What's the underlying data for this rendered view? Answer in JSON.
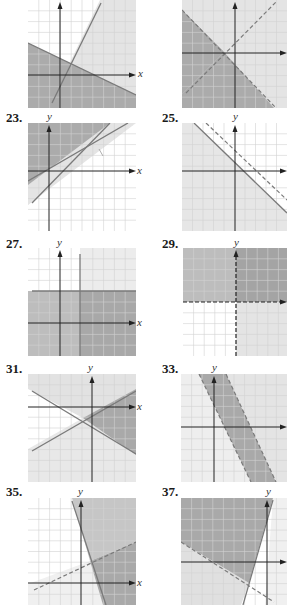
{
  "page": {
    "type": "textbook answer key — graphs of systems of linear inequalities"
  },
  "axis_labels": {
    "x": "x",
    "y": "y"
  },
  "colors": {
    "background": "#ffffff",
    "grid_line": "#d0d0d0",
    "light_shade": "#e6e6e6",
    "dark_shade": "#a9a9a9",
    "boundary_line": "#7a7a7a",
    "axis": "#222222"
  },
  "problems": [
    {
      "number": "",
      "description": "Two solid lines: steep increasing line and decreasing line; region below decreasing line shaded dark (overlap), lighter shade right of steep line"
    },
    {
      "number": "",
      "description": "Two dashed lines crossing left of origin forming X; left and bottom wedge shaded dark"
    },
    {
      "number": "23.",
      "description": "Two solid increasing lines; region above both shaded dark"
    },
    {
      "number": "25.",
      "description": "Two parallel decreasing lines (solid and dashed); region below solid line shaded light"
    },
    {
      "number": "27.",
      "description": "Solid vertical line x≈2 and solid horizontal line y≈3; region below horizontal shaded, right of vertical darker"
    },
    {
      "number": "29.",
      "description": "Dashed axes boundaries; upper half shaded, first quadrant darkest"
    },
    {
      "number": "31.",
      "description": "Two solid lines crossing below origin; right wedge shaded dark"
    },
    {
      "number": "33.",
      "description": "Two parallel dashed decreasing steep lines; band between shaded dark"
    },
    {
      "number": "35.",
      "description": "Solid steep decreasing line and dashed increasing line; region right of solid and below dashed shaded dark"
    },
    {
      "number": "37.",
      "description": "Solid steep increasing line and dashed decreasing line; region left of solid and above dashed shaded dark"
    }
  ]
}
